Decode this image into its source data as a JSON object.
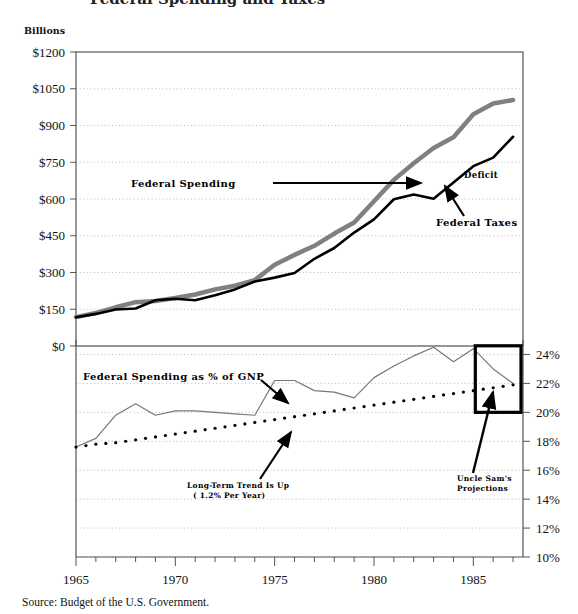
{
  "figure": {
    "units_label": "Billions",
    "source_note": "Source: Budget of the U.S. Government.",
    "clipped_title": "Federal Spending and Taxes",
    "colors": {
      "spending_line": "#808080",
      "taxes_line": "#000000",
      "gnp_line": "#777777",
      "trend_dots": "#000000",
      "grid": "#aaaaaa",
      "frame": "#555555",
      "projection_box": "#000000"
    }
  },
  "annotations": {
    "federal_spending": "Federal Spending",
    "federal_taxes": "Federal Taxes",
    "deficit": "Deficit",
    "gnp_share": "Federal Spending as % of GNP",
    "trend_line1": "Long-Term Trend Is Up",
    "trend_line2": "( 1.2% Per Year)",
    "projections_line1": "Uncle Sam's",
    "projections_line2": "Projections"
  },
  "chart_data": [
    {
      "type": "line",
      "id": "upper-panel",
      "title": "",
      "xlabel": "",
      "ylabel": "Billions",
      "xlim": [
        1965,
        1987.5
      ],
      "ylim": [
        0,
        1200
      ],
      "grid": true,
      "legend": "annotated-inline",
      "xticks": [
        1965,
        1970,
        1975,
        1980,
        1985
      ],
      "yticks": [
        0,
        150,
        300,
        450,
        600,
        750,
        900,
        1050,
        1200
      ],
      "ytick_labels": [
        "$0",
        "$150",
        "$300",
        "$450",
        "$600",
        "$750",
        "$900",
        "$1050",
        "$1200"
      ],
      "x": [
        1965,
        1966,
        1967,
        1968,
        1969,
        1970,
        1971,
        1972,
        1973,
        1974,
        1975,
        1976,
        1977,
        1978,
        1979,
        1980,
        1981,
        1982,
        1983,
        1984,
        1985,
        1986,
        1987
      ],
      "series": [
        {
          "name": "Federal Spending",
          "color": "#808080",
          "width": 4.5,
          "values": [
            118,
            135,
            158,
            179,
            184,
            196,
            210,
            231,
            246,
            269,
            332,
            372,
            409,
            459,
            504,
            591,
            678,
            746,
            808,
            852,
            946,
            990,
            1004
          ]
        },
        {
          "name": "Federal Taxes",
          "color": "#000000",
          "width": 2.6,
          "values": [
            117,
            131,
            149,
            153,
            187,
            193,
            187,
            207,
            231,
            263,
            279,
            298,
            356,
            400,
            463,
            517,
            599,
            618,
            601,
            667,
            734,
            769,
            854
          ]
        }
      ]
    },
    {
      "type": "line",
      "id": "lower-panel",
      "title": "",
      "xlabel": "",
      "ylabel": "Percent of GNP",
      "xlim": [
        1965,
        1987.5
      ],
      "ylim": [
        10,
        25
      ],
      "grid": true,
      "yaxis_side": "right",
      "xticks": [
        1965,
        1970,
        1975,
        1980,
        1985
      ],
      "yticks": [
        10,
        12,
        14,
        16,
        18,
        20,
        22,
        24
      ],
      "ytick_labels": [
        "10%",
        "12%",
        "14%",
        "16%",
        "18%",
        "20%",
        "22%",
        "24%"
      ],
      "x": [
        1965,
        1966,
        1967,
        1968,
        1969,
        1970,
        1971,
        1972,
        1973,
        1974,
        1975,
        1976,
        1977,
        1978,
        1979,
        1980,
        1981,
        1982,
        1983,
        1984,
        1985,
        1986,
        1987
      ],
      "series": [
        {
          "name": "Federal Spending as % of GNP",
          "color": "#777777",
          "width": 1.2,
          "style": "solid",
          "values": [
            17.6,
            18.2,
            19.8,
            20.6,
            19.8,
            20.1,
            20.1,
            20.0,
            19.9,
            19.8,
            22.2,
            22.2,
            21.5,
            21.4,
            21.0,
            22.4,
            23.2,
            23.9,
            24.5,
            23.5,
            24.4,
            23.0,
            22.0
          ]
        },
        {
          "name": "Long-Term Trend",
          "color": "#000000",
          "width": 3.2,
          "style": "dotted",
          "values": [
            17.6,
            17.8,
            17.9,
            18.1,
            18.3,
            18.5,
            18.7,
            18.9,
            19.1,
            19.3,
            19.5,
            19.7,
            19.9,
            20.1,
            20.3,
            20.5,
            20.7,
            20.9,
            21.1,
            21.3,
            21.5,
            21.7,
            21.9
          ]
        }
      ],
      "highlight_box": {
        "label": "Uncle Sam's Projections",
        "x_start": 1985.1,
        "x_end": 1987.4,
        "y_start": 20.0,
        "y_end": 24.6
      }
    }
  ]
}
